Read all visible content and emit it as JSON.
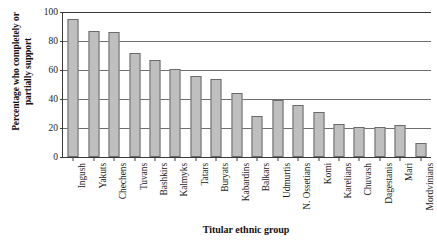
{
  "chart_data": {
    "type": "bar",
    "title": "",
    "xlabel": "Titular ethnic group",
    "ylabel": "Percentage who completely or partially support",
    "ylabel_line1": "Percentage who completely or",
    "ylabel_line2": "partially support",
    "ylim": [
      0,
      100
    ],
    "yticks": [
      0,
      20,
      40,
      60,
      80,
      100
    ],
    "ytick_labels": [
      "0",
      "20",
      "40",
      "60",
      "80",
      "100"
    ],
    "grid": "horizontal",
    "legend": "none",
    "bar_color": "#bfbfbf",
    "bar_edge_color": "#6b6b6b",
    "axis_color": "#3a3a3a",
    "categories": [
      "Ingush",
      "Yakuts",
      "Chechens",
      "Tuvans",
      "Bashkirs",
      "Kalmyks",
      "Tatars",
      "Buryats",
      "Kabardins",
      "Balkars",
      "Udmurtis",
      "N. Ossetians",
      "Komi",
      "Karelians",
      "Chuvash",
      "Dagestanis",
      "Mari",
      "Mordvinians"
    ],
    "values": [
      95,
      87,
      86,
      72,
      67,
      61,
      56,
      54,
      44,
      28,
      39,
      36,
      31,
      23,
      21,
      21,
      22,
      10
    ]
  }
}
